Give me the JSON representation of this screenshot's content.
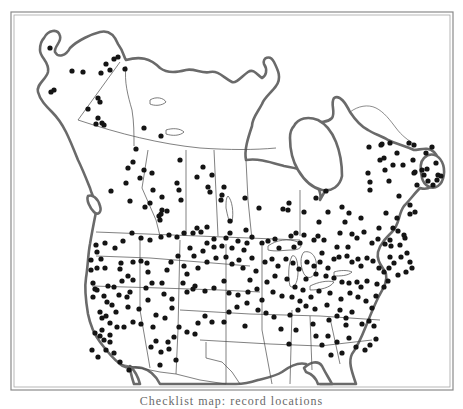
{
  "figure": {
    "type": "point distribution map",
    "region": "North America (Alaska, Canada, contiguous United States)",
    "caption": "Checklist map: record locations",
    "caption_visible_note": "caption text cut off at bottom edge",
    "colors": {
      "dot": "#141414",
      "land_line": "#5a5a5a",
      "frame": "#8a8a8a",
      "background": "#ffffff"
    }
  },
  "regions": {
    "alaska": {
      "label": "Alaska"
    },
    "canada": {
      "label": "Canada"
    },
    "usa": {
      "label": "United States"
    },
    "hudson_bay": {
      "label": "Hudson Bay"
    },
    "great_lakes": {
      "label": "Great Lakes"
    }
  },
  "dots": [
    [
      50,
      48
    ],
    [
      72,
      71
    ],
    [
      83,
      72
    ],
    [
      106,
      64
    ],
    [
      110,
      70
    ],
    [
      114,
      59
    ],
    [
      118,
      57
    ],
    [
      125,
      69
    ],
    [
      101,
      73
    ],
    [
      98,
      98
    ],
    [
      100,
      102
    ],
    [
      54,
      90
    ],
    [
      51,
      92
    ],
    [
      88,
      109
    ],
    [
      98,
      118
    ],
    [
      96,
      124
    ],
    [
      102,
      123
    ],
    [
      104,
      125
    ],
    [
      144,
      128
    ],
    [
      161,
      136
    ],
    [
      136,
      149
    ],
    [
      133,
      162
    ],
    [
      128,
      168
    ],
    [
      144,
      170
    ],
    [
      152,
      173
    ],
    [
      140,
      178
    ],
    [
      126,
      183
    ],
    [
      153,
      190
    ],
    [
      111,
      191
    ],
    [
      130,
      201
    ],
    [
      162,
      197
    ],
    [
      150,
      203
    ],
    [
      180,
      160
    ],
    [
      177,
      183
    ],
    [
      179,
      190
    ],
    [
      181,
      200
    ],
    [
      162,
      210
    ],
    [
      167,
      211
    ],
    [
      145,
      207
    ],
    [
      160,
      220
    ],
    [
      159,
      216
    ],
    [
      161,
      214
    ],
    [
      203,
      167
    ],
    [
      197,
      177
    ],
    [
      212,
      175
    ],
    [
      208,
      187
    ],
    [
      210,
      192
    ],
    [
      222,
      195
    ],
    [
      224,
      187
    ],
    [
      221,
      200
    ],
    [
      245,
      198
    ],
    [
      259,
      208
    ],
    [
      246,
      230
    ],
    [
      230,
      221
    ],
    [
      283,
      209
    ],
    [
      289,
      203
    ],
    [
      288,
      210
    ],
    [
      304,
      212
    ],
    [
      296,
      233
    ],
    [
      300,
      243
    ],
    [
      342,
      207
    ],
    [
      349,
      213
    ],
    [
      319,
      222
    ],
    [
      328,
      212
    ],
    [
      345,
      222
    ],
    [
      361,
      218
    ],
    [
      316,
      198
    ],
    [
      326,
      191
    ],
    [
      370,
      182
    ],
    [
      370,
      190
    ],
    [
      368,
      173
    ],
    [
      380,
      160
    ],
    [
      385,
      170
    ],
    [
      393,
      165
    ],
    [
      389,
      181
    ],
    [
      397,
      153
    ],
    [
      409,
      143
    ],
    [
      414,
      145
    ],
    [
      422,
      170
    ],
    [
      427,
      169
    ],
    [
      424,
      175
    ],
    [
      415,
      172
    ],
    [
      413,
      160
    ],
    [
      426,
      153
    ],
    [
      432,
      147
    ],
    [
      436,
      163
    ],
    [
      438,
      175
    ],
    [
      433,
      185
    ],
    [
      437,
      180
    ],
    [
      417,
      185
    ],
    [
      381,
      145
    ],
    [
      384,
      158
    ],
    [
      369,
      147
    ],
    [
      382,
      144
    ],
    [
      390,
      143
    ],
    [
      403,
      165
    ],
    [
      414,
      173
    ],
    [
      428,
      181
    ],
    [
      441,
      176
    ],
    [
      399,
      196
    ],
    [
      410,
      205
    ],
    [
      410,
      214
    ],
    [
      415,
      212
    ],
    [
      397,
      218
    ],
    [
      398,
      231
    ],
    [
      386,
      213
    ],
    [
      393,
      228
    ],
    [
      400,
      245
    ],
    [
      404,
      235
    ],
    [
      390,
      240
    ],
    [
      391,
      246
    ],
    [
      405,
      238
    ],
    [
      379,
      228
    ],
    [
      385,
      244
    ],
    [
      378,
      239
    ],
    [
      372,
      243
    ],
    [
      364,
      232
    ],
    [
      357,
      238
    ],
    [
      352,
      234
    ],
    [
      348,
      247
    ],
    [
      340,
      233
    ],
    [
      337,
      247
    ],
    [
      324,
      240
    ],
    [
      322,
      253
    ],
    [
      314,
      240
    ],
    [
      318,
      236
    ],
    [
      304,
      235
    ],
    [
      291,
      236
    ],
    [
      294,
      247
    ],
    [
      279,
      248
    ],
    [
      275,
      239
    ],
    [
      268,
      241
    ],
    [
      262,
      243
    ],
    [
      252,
      237
    ],
    [
      247,
      243
    ],
    [
      238,
      241
    ],
    [
      226,
      238
    ],
    [
      230,
      233
    ],
    [
      214,
      239
    ],
    [
      207,
      243
    ],
    [
      207,
      227
    ],
    [
      201,
      232
    ],
    [
      197,
      228
    ],
    [
      193,
      233
    ],
    [
      184,
      233
    ],
    [
      177,
      237
    ],
    [
      169,
      235
    ],
    [
      161,
      237
    ],
    [
      150,
      240
    ],
    [
      141,
      238
    ],
    [
      132,
      233
    ],
    [
      123,
      241
    ],
    [
      115,
      248
    ],
    [
      105,
      243
    ],
    [
      96,
      245
    ],
    [
      101,
      259
    ],
    [
      91,
      260
    ],
    [
      97,
      252
    ],
    [
      91,
      270
    ],
    [
      97,
      268
    ],
    [
      93,
      283
    ],
    [
      95,
      289
    ],
    [
      93,
      297
    ],
    [
      107,
      302
    ],
    [
      112,
      305
    ],
    [
      114,
      287
    ],
    [
      122,
      281
    ],
    [
      128,
      276
    ],
    [
      133,
      280
    ],
    [
      130,
      292
    ],
    [
      127,
      297
    ],
    [
      128,
      307
    ],
    [
      139,
      309
    ],
    [
      148,
      300
    ],
    [
      146,
      288
    ],
    [
      152,
      283
    ],
    [
      148,
      272
    ],
    [
      147,
      263
    ],
    [
      141,
      261
    ],
    [
      133,
      262
    ],
    [
      121,
      263
    ],
    [
      120,
      269
    ],
    [
      105,
      268
    ],
    [
      108,
      286
    ],
    [
      119,
      295
    ],
    [
      106,
      316
    ],
    [
      110,
      323
    ],
    [
      102,
      330
    ],
    [
      100,
      336
    ],
    [
      104,
      340
    ],
    [
      110,
      342
    ],
    [
      114,
      353
    ],
    [
      120,
      362
    ],
    [
      129,
      370
    ],
    [
      117,
      327
    ],
    [
      124,
      327
    ],
    [
      133,
      322
    ],
    [
      141,
      324
    ],
    [
      153,
      327
    ],
    [
      156,
      315
    ],
    [
      165,
      318
    ],
    [
      172,
      308
    ],
    [
      172,
      299
    ],
    [
      164,
      294
    ],
    [
      162,
      283
    ],
    [
      167,
      270
    ],
    [
      171,
      262
    ],
    [
      178,
      256
    ],
    [
      184,
      266
    ],
    [
      187,
      274
    ],
    [
      193,
      289
    ],
    [
      183,
      283
    ],
    [
      187,
      292
    ],
    [
      195,
      286
    ],
    [
      205,
      291
    ],
    [
      214,
      288
    ],
    [
      224,
      281
    ],
    [
      229,
      293
    ],
    [
      238,
      295
    ],
    [
      248,
      292
    ],
    [
      257,
      289
    ],
    [
      262,
      300
    ],
    [
      250,
      280
    ],
    [
      243,
      268
    ],
    [
      239,
      260
    ],
    [
      232,
      264
    ],
    [
      226,
      257
    ],
    [
      216,
      258
    ],
    [
      207,
      262
    ],
    [
      198,
      268
    ],
    [
      194,
      256
    ],
    [
      190,
      248
    ],
    [
      203,
      251
    ],
    [
      214,
      247
    ],
    [
      222,
      246
    ],
    [
      232,
      248
    ],
    [
      244,
      250
    ],
    [
      252,
      258
    ],
    [
      256,
      271
    ],
    [
      265,
      262
    ],
    [
      272,
      259
    ],
    [
      278,
      266
    ],
    [
      286,
      259
    ],
    [
      293,
      263
    ],
    [
      299,
      269
    ],
    [
      307,
      262
    ],
    [
      314,
      266
    ],
    [
      320,
      262
    ],
    [
      328,
      268
    ],
    [
      334,
      259
    ],
    [
      339,
      257
    ],
    [
      347,
      256
    ],
    [
      352,
      262
    ],
    [
      358,
      259
    ],
    [
      361,
      266
    ],
    [
      367,
      258
    ],
    [
      373,
      261
    ],
    [
      379,
      268
    ],
    [
      384,
      272
    ],
    [
      389,
      268
    ],
    [
      390,
      257
    ],
    [
      394,
      263
    ],
    [
      401,
      257
    ],
    [
      407,
      253
    ],
    [
      410,
      262
    ],
    [
      412,
      268
    ],
    [
      406,
      272
    ],
    [
      398,
      275
    ],
    [
      388,
      281
    ],
    [
      384,
      287
    ],
    [
      377,
      284
    ],
    [
      367,
      281
    ],
    [
      361,
      287
    ],
    [
      357,
      282
    ],
    [
      349,
      283
    ],
    [
      342,
      282
    ],
    [
      334,
      278
    ],
    [
      326,
      276
    ],
    [
      316,
      274
    ],
    [
      306,
      279
    ],
    [
      303,
      290
    ],
    [
      295,
      287
    ],
    [
      287,
      279
    ],
    [
      275,
      276
    ],
    [
      267,
      282
    ],
    [
      273,
      292
    ],
    [
      282,
      296
    ],
    [
      292,
      297
    ],
    [
      300,
      301
    ],
    [
      311,
      297
    ],
    [
      319,
      291
    ],
    [
      330,
      293
    ],
    [
      341,
      299
    ],
    [
      350,
      293
    ],
    [
      358,
      297
    ],
    [
      366,
      301
    ],
    [
      376,
      296
    ],
    [
      372,
      308
    ],
    [
      369,
      321
    ],
    [
      362,
      324
    ],
    [
      374,
      326
    ],
    [
      352,
      312
    ],
    [
      346,
      318
    ],
    [
      337,
      316
    ],
    [
      329,
      320
    ],
    [
      315,
      309
    ],
    [
      306,
      306
    ],
    [
      298,
      310
    ],
    [
      290,
      315
    ],
    [
      274,
      317
    ],
    [
      266,
      313
    ],
    [
      258,
      310
    ],
    [
      247,
      303
    ],
    [
      237,
      307
    ],
    [
      229,
      312
    ],
    [
      224,
      322
    ],
    [
      212,
      322
    ],
    [
      205,
      316
    ],
    [
      198,
      323
    ],
    [
      195,
      334
    ],
    [
      187,
      332
    ],
    [
      179,
      327
    ],
    [
      174,
      337
    ],
    [
      168,
      342
    ],
    [
      156,
      341
    ],
    [
      151,
      347
    ],
    [
      161,
      352
    ],
    [
      169,
      349
    ],
    [
      176,
      360
    ],
    [
      160,
      365
    ],
    [
      245,
      326
    ],
    [
      281,
      329
    ],
    [
      289,
      344
    ],
    [
      313,
      324
    ],
    [
      316,
      336
    ],
    [
      328,
      336
    ],
    [
      337,
      342
    ],
    [
      346,
      325
    ],
    [
      376,
      339
    ],
    [
      370,
      345
    ],
    [
      365,
      350
    ],
    [
      356,
      347
    ],
    [
      349,
      338
    ],
    [
      342,
      353
    ],
    [
      331,
      355
    ],
    [
      322,
      345
    ],
    [
      340,
      310
    ],
    [
      327,
      305
    ],
    [
      296,
      330
    ],
    [
      100,
      312
    ],
    [
      97,
      290
    ],
    [
      104,
      296
    ],
    [
      110,
      335
    ],
    [
      106,
      350
    ],
    [
      98,
      357
    ],
    [
      92,
      350
    ],
    [
      95,
      333
    ],
    [
      102,
      318
    ],
    [
      116,
      312
    ]
  ],
  "dot_count": 400,
  "frame": {
    "x": 11,
    "y": 12,
    "width": 442,
    "height": 378
  }
}
